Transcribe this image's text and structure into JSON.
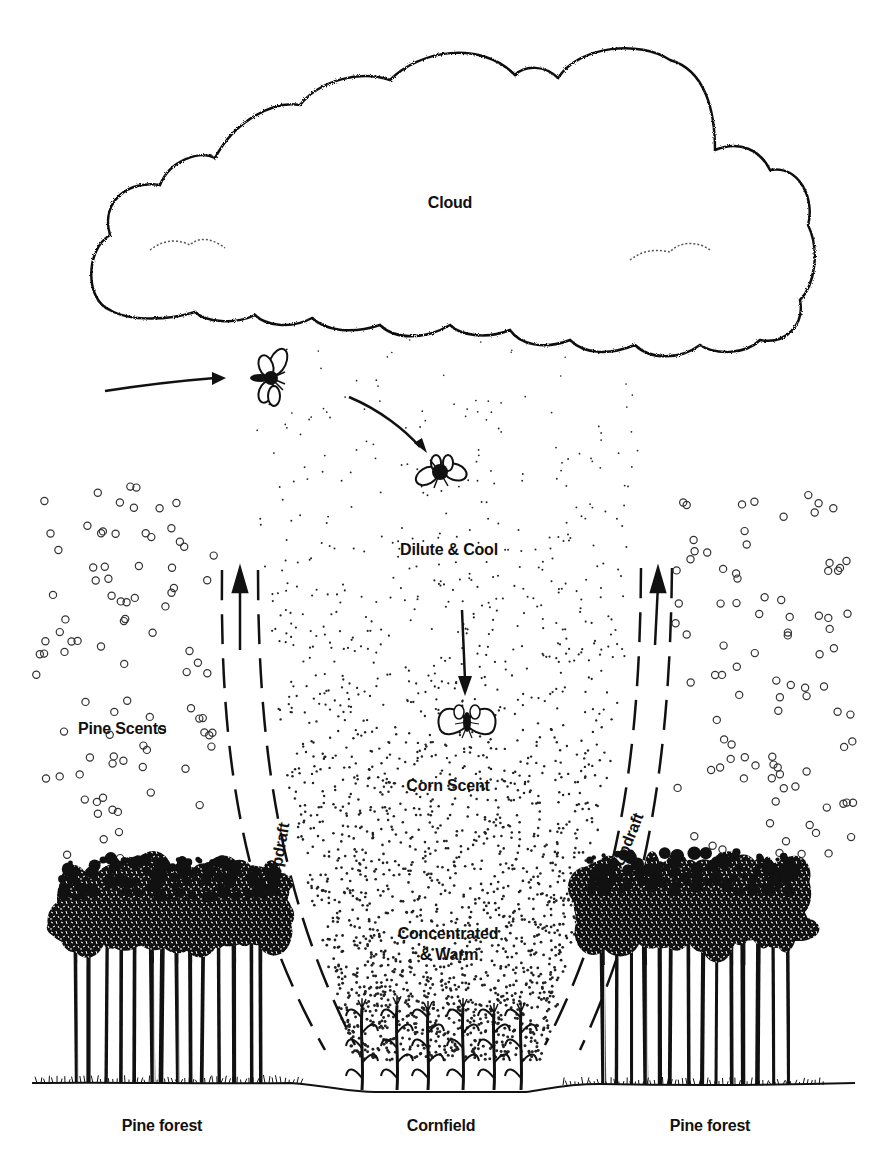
{
  "diagram": {
    "colors": {
      "ink": "#111111",
      "background": "#ffffff"
    },
    "labels": {
      "cloud": "Cloud",
      "dilute": "Dilute & Cool",
      "corn_scent": "Corn Scent",
      "concentrated_line1": "Concentrated",
      "concentrated_line2": "& Warm",
      "pine_scents": "Pine Scents",
      "updraft_left": "Updraft",
      "updraft_right": "Updraft",
      "pine_forest_left": "Pine forest",
      "cornfield": "Cornfield",
      "pine_forest_right": "Pine forest"
    },
    "elements": {
      "cloud": "stippled cumulus cloud",
      "insects": [
        "moth-flying-in",
        "moth-descending",
        "moth-in-corn-scent"
      ],
      "arrows": [
        "arrow-into-plume",
        "arrow-curving-down",
        "arrow-down-to-corn-scent",
        "updraft-arrow-left",
        "updraft-arrow-right"
      ],
      "scent_plume": "stippled plume widening from cornfield up to cloud",
      "pine_scent_particles": "open circles on both sides",
      "trees": [
        "pine-forest-left",
        "pine-forest-right"
      ],
      "corn_plants": 6
    }
  }
}
